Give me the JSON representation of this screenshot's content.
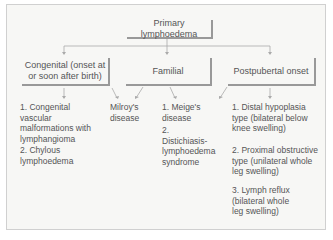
{
  "root": {
    "label": "Primary lymphoedema"
  },
  "categories": [
    {
      "label": "Congenital (onset at or soon after birth)"
    },
    {
      "label": "Familial"
    },
    {
      "label": "Postpubertal onset"
    }
  ],
  "congenital_items": [
    "1. Congenital vascular malformations with lymphangioma",
    "2. Chylous lymphoedema"
  ],
  "shared_item": "Milroy's disease",
  "familial_items": [
    "1. Meige's disease",
    "2. Distichiasis-lymphoedema syndrome"
  ],
  "postpubertal_items": [
    "1. Distal hypoplasia type (bilateral below knee swelling)",
    "2. Proximal obstructive type (unilateral whole leg swelling)",
    "3. Lymph reflux (bilateral whole leg swelling)"
  ],
  "colors": {
    "background": "#f7f7f5",
    "text": "#555555",
    "lines": "#999999"
  }
}
